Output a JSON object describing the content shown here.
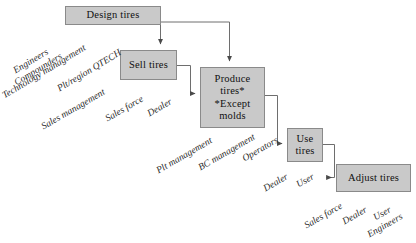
{
  "diagram": {
    "type": "process-flow",
    "title": "",
    "style": {
      "box_fill": "#c9c9c9",
      "box_border": "#8a8a8a",
      "connector_color": "#6e6e6e",
      "background": "#ffffff",
      "label_color": "#2b2b2b"
    },
    "nodes": [
      {
        "id": "design",
        "label": "Design tires",
        "lines": [
          "Design tires"
        ]
      },
      {
        "id": "sell",
        "label": "Sell tires",
        "lines": [
          "Sell tires"
        ]
      },
      {
        "id": "produce",
        "label": "Produce tires* *Except molds",
        "lines": [
          "Produce",
          "tires*",
          "*Except",
          "molds"
        ]
      },
      {
        "id": "use",
        "label": "Use tires",
        "lines": [
          "Use",
          "tires"
        ]
      },
      {
        "id": "adjust",
        "label": "Adjust tires",
        "lines": [
          "Adjust tires"
        ]
      }
    ],
    "connectors": [
      {
        "from": "design",
        "to": "sell"
      },
      {
        "from": "design",
        "to": "produce"
      },
      {
        "from": "sell",
        "to": "produce"
      },
      {
        "from": "produce",
        "to": "use"
      },
      {
        "from": "use",
        "to": "adjust"
      }
    ],
    "role_groups": [
      {
        "id": "design-roles",
        "attached_to": "design",
        "roles": [
          "Engineers",
          "Compounders",
          "Technology management",
          "Plt/region QTECH"
        ]
      },
      {
        "id": "sell-roles",
        "attached_to": "sell",
        "roles": [
          "Sales management",
          "Sales force",
          "Dealer"
        ]
      },
      {
        "id": "produce-roles",
        "attached_to": "produce",
        "roles": [
          "Plt management",
          "BC management",
          "Operators"
        ]
      },
      {
        "id": "use-roles",
        "attached_to": "use",
        "roles": [
          "Dealer",
          "User"
        ]
      },
      {
        "id": "adjust-roles",
        "attached_to": "adjust",
        "roles": [
          "Sales force",
          "Dealer",
          "User",
          "Engineers"
        ]
      }
    ]
  }
}
